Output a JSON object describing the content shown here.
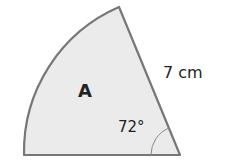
{
  "diagram": {
    "shape": "sector",
    "sector_label": "A",
    "radius_label": "7 cm",
    "angle_label": "72°",
    "colors": {
      "fill": "#ebebeb",
      "stroke": "#777777"
    }
  }
}
